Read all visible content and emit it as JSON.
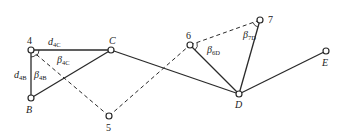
{
  "diagram": {
    "points": [
      {
        "id": "4",
        "label": "4",
        "italic": false
      },
      {
        "id": "B",
        "label": "B",
        "italic": true
      },
      {
        "id": "C",
        "label": "C",
        "italic": true
      },
      {
        "id": "5",
        "label": "5",
        "italic": false
      },
      {
        "id": "6",
        "label": "6",
        "italic": false
      },
      {
        "id": "7",
        "label": "7",
        "italic": false
      },
      {
        "id": "D",
        "label": "D",
        "italic": true
      },
      {
        "id": "E",
        "label": "E",
        "italic": true
      }
    ],
    "solid_edges": [
      [
        "4",
        "C"
      ],
      [
        "4",
        "B"
      ],
      [
        "B",
        "C"
      ],
      [
        "C",
        "D"
      ],
      [
        "6",
        "D"
      ],
      [
        "7",
        "D"
      ],
      [
        "D",
        "E"
      ]
    ],
    "dashed_edges": [
      [
        "4",
        "5"
      ],
      [
        "5",
        "6"
      ],
      [
        "6",
        "7"
      ]
    ],
    "annotations": {
      "d4C": {
        "main": "d",
        "sub": "4C"
      },
      "d4B": {
        "main": "d",
        "sub": "4B"
      },
      "beta4C": {
        "main": "β",
        "sub": "4C"
      },
      "beta4B": {
        "main": "β",
        "sub": "4B"
      },
      "beta6D": {
        "main": "β",
        "sub": "6D"
      },
      "beta7D": {
        "main": "β",
        "sub": "7D"
      }
    }
  }
}
